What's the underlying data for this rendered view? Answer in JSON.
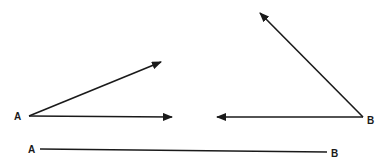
{
  "diagram": {
    "stroke_color": "#1a1a1a",
    "background": "#ffffff",
    "figures": [
      {
        "id": "angle-a",
        "vertex_label": "A",
        "vertex": [
          29,
          116
        ],
        "label_pos": [
          14,
          120
        ],
        "rays": [
          {
            "to": [
              161,
              62
            ]
          },
          {
            "to": [
              172,
              117
            ]
          }
        ]
      },
      {
        "id": "angle-b",
        "vertex_label": "B",
        "vertex": [
          363,
          117
        ],
        "label_pos": [
          367,
          124
        ],
        "rays": [
          {
            "to": [
              260,
              13
            ]
          },
          {
            "to": [
              217,
              117
            ]
          }
        ]
      }
    ],
    "segment": {
      "start_label": "A",
      "end_label": "B",
      "start": [
        40,
        149
      ],
      "end": [
        327,
        152
      ],
      "start_label_pos": [
        28,
        153
      ],
      "end_label_pos": [
        331,
        157
      ]
    }
  }
}
